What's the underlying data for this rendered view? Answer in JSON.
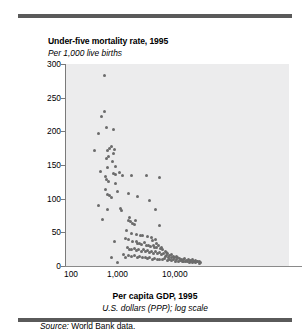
{
  "figure": {
    "title": "Under-five mortality rate, 1995",
    "subtitle": "Per 1,000 live births",
    "x_axis_title": "Per capita GDP, 1995",
    "x_axis_subtitle": "U.S. dollars (PPP); log scale",
    "source_label": "Source:",
    "source_text": " World Bank data.",
    "colors": {
      "rule": "#5a5a5a",
      "plot_background": "#ececed",
      "point": "#6b6b6b",
      "axis": "#7a7a7a",
      "text": "#000000"
    }
  },
  "chart_data": {
    "type": "scatter",
    "title": "Under-five mortality rate, 1995",
    "subtitle": "Per 1,000 live births",
    "xlabel": "Per capita GDP, 1995",
    "xlabel_sub": "U.S. dollars (PPP); log scale",
    "ylabel": "Per 1,000 live births",
    "xscale": "log",
    "yscale": "linear",
    "xlim": [
      100,
      50000
    ],
    "ylim": [
      0,
      300
    ],
    "xticks": [
      100,
      1000,
      10000
    ],
    "xticklabels": [
      "100",
      "1,000",
      "10,000"
    ],
    "yticks": [
      0,
      50,
      100,
      150,
      200,
      250,
      300
    ],
    "yticklabels": [
      "0",
      "50",
      "100",
      "150",
      "200",
      "250",
      "300"
    ],
    "grid": false,
    "legend": null,
    "marker": "circle",
    "points": [
      [
        520,
        283
      ],
      [
        460,
        222
      ],
      [
        520,
        230
      ],
      [
        400,
        197
      ],
      [
        560,
        205
      ],
      [
        350,
        171
      ],
      [
        760,
        202
      ],
      [
        640,
        174
      ],
      [
        600,
        172
      ],
      [
        630,
        163
      ],
      [
        560,
        159
      ],
      [
        700,
        177
      ],
      [
        760,
        167
      ],
      [
        790,
        173
      ],
      [
        720,
        155
      ],
      [
        440,
        141
      ],
      [
        600,
        147
      ],
      [
        540,
        133
      ],
      [
        820,
        148
      ],
      [
        770,
        137
      ],
      [
        840,
        136
      ],
      [
        1100,
        135
      ],
      [
        960,
        139
      ],
      [
        1600,
        135
      ],
      [
        3000,
        134
      ],
      [
        5200,
        132
      ],
      [
        580,
        128
      ],
      [
        620,
        126
      ],
      [
        820,
        122
      ],
      [
        540,
        113
      ],
      [
        600,
        106
      ],
      [
        640,
        104
      ],
      [
        700,
        101
      ],
      [
        900,
        110
      ],
      [
        1400,
        107
      ],
      [
        2100,
        103
      ],
      [
        3500,
        97
      ],
      [
        400,
        90
      ],
      [
        600,
        84
      ],
      [
        1000,
        85
      ],
      [
        1050,
        83
      ],
      [
        4400,
        84
      ],
      [
        480,
        69
      ],
      [
        1500,
        72
      ],
      [
        1400,
        68
      ],
      [
        1550,
        66
      ],
      [
        1700,
        63
      ],
      [
        1900,
        67
      ],
      [
        1850,
        62
      ],
      [
        5200,
        60
      ],
      [
        1300,
        53
      ],
      [
        1600,
        48
      ],
      [
        2000,
        47
      ],
      [
        2400,
        46
      ],
      [
        2600,
        45
      ],
      [
        3200,
        44
      ],
      [
        3800,
        42
      ],
      [
        4400,
        40
      ],
      [
        1250,
        41
      ],
      [
        1450,
        39
      ],
      [
        1700,
        36
      ],
      [
        2000,
        37
      ],
      [
        2100,
        34
      ],
      [
        2300,
        33
      ],
      [
        2500,
        32
      ],
      [
        2800,
        35
      ],
      [
        3000,
        31
      ],
      [
        3300,
        30
      ],
      [
        3600,
        29
      ],
      [
        4000,
        31
      ],
      [
        4300,
        28
      ],
      [
        4700,
        27
      ],
      [
        5000,
        30
      ],
      [
        5400,
        26
      ],
      [
        800,
        36
      ],
      [
        1350,
        28
      ],
      [
        1500,
        25
      ],
      [
        1650,
        24
      ],
      [
        1800,
        26
      ],
      [
        2000,
        23
      ],
      [
        2200,
        25
      ],
      [
        2450,
        22
      ],
      [
        2700,
        24
      ],
      [
        2900,
        21
      ],
      [
        3100,
        23
      ],
      [
        3400,
        20
      ],
      [
        3700,
        22
      ],
      [
        4100,
        19
      ],
      [
        4500,
        21
      ],
      [
        4900,
        18
      ],
      [
        5300,
        20
      ],
      [
        5800,
        17
      ],
      [
        6300,
        19
      ],
      [
        6900,
        16
      ],
      [
        7400,
        18
      ],
      [
        8000,
        15
      ],
      [
        8600,
        17
      ],
      [
        9300,
        14
      ],
      [
        1400,
        16
      ],
      [
        1600,
        14
      ],
      [
        1800,
        15
      ],
      [
        2100,
        13
      ],
      [
        2300,
        14
      ],
      [
        2600,
        12
      ],
      [
        2900,
        13
      ],
      [
        3200,
        11
      ],
      [
        3500,
        12
      ],
      [
        3900,
        10
      ],
      [
        4300,
        11
      ],
      [
        4800,
        9
      ],
      [
        5300,
        10
      ],
      [
        5900,
        9
      ],
      [
        6500,
        11
      ],
      [
        7200,
        8
      ],
      [
        7800,
        10
      ],
      [
        8500,
        8
      ],
      [
        9200,
        9
      ],
      [
        10000,
        7
      ],
      [
        10800,
        9
      ],
      [
        11600,
        7
      ],
      [
        12500,
        8
      ],
      [
        13500,
        6
      ],
      [
        14500,
        7
      ],
      [
        15600,
        6
      ],
      [
        16800,
        7
      ],
      [
        18000,
        5
      ],
      [
        19500,
        6
      ],
      [
        21000,
        5
      ],
      [
        22500,
        6
      ],
      [
        24000,
        5
      ],
      [
        26000,
        6
      ],
      [
        28000,
        4
      ],
      [
        700,
        12
      ],
      [
        900,
        5
      ],
      [
        1150,
        17
      ],
      [
        1250,
        13
      ],
      [
        6000,
        24
      ],
      [
        6600,
        22
      ],
      [
        7100,
        20
      ],
      [
        5600,
        28
      ],
      [
        4600,
        33
      ],
      [
        3950,
        38
      ],
      [
        11000,
        12
      ],
      [
        12000,
        11
      ],
      [
        13000,
        10
      ],
      [
        14000,
        9
      ],
      [
        15000,
        11
      ],
      [
        16000,
        8
      ],
      [
        17500,
        10
      ],
      [
        19000,
        8
      ],
      [
        20500,
        9
      ],
      [
        22000,
        7
      ],
      [
        23500,
        8
      ],
      [
        25500,
        6
      ],
      [
        27500,
        7
      ],
      [
        29500,
        5
      ],
      [
        9800,
        13
      ],
      [
        10500,
        14
      ],
      [
        8800,
        12
      ],
      [
        7600,
        13
      ],
      [
        6800,
        14
      ]
    ]
  }
}
